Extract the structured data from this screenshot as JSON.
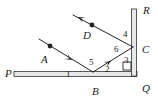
{
  "figure": {
    "type": "geometry-optics-diagram",
    "width": 158,
    "height": 99,
    "background_color": "#ffffff",
    "line_color": "#222222",
    "mirror_fill_color": "#e8e8e8"
  },
  "point_labels": [
    {
      "id": "P",
      "text": "P",
      "x": 5,
      "y": 68,
      "desc": "left end of horizontal mirror"
    },
    {
      "id": "A",
      "text": "A",
      "x": 41,
      "y": 54,
      "desc": "incident ray label"
    },
    {
      "id": "D",
      "text": "D",
      "x": 83,
      "y": 30,
      "desc": "outgoing reflected ray label"
    },
    {
      "id": "B",
      "text": "B",
      "x": 92,
      "y": 86,
      "desc": "reflection point on horizontal mirror"
    },
    {
      "id": "C",
      "text": "C",
      "x": 142,
      "y": 44,
      "desc": "reflection point on vertical mirror"
    },
    {
      "id": "R",
      "text": "R",
      "x": 143,
      "y": 5,
      "desc": "top end of vertical mirror"
    },
    {
      "id": "Q",
      "text": "Q",
      "x": 142,
      "y": 83,
      "desc": "bottom end of vertical mirror"
    }
  ],
  "angle_labels": [
    {
      "id": "angle1",
      "text": "1",
      "x": 66,
      "y": 70,
      "desc": "angle of incidence at B, left side"
    },
    {
      "id": "angle5",
      "text": "5",
      "x": 89,
      "y": 58,
      "desc": "angle between incident and reflected ray at B"
    },
    {
      "id": "angle2",
      "text": "2",
      "x": 105,
      "y": 65,
      "desc": "angle of reflection at B, right side"
    },
    {
      "id": "angle6",
      "text": "6",
      "x": 114,
      "y": 45,
      "desc": "angle at C between ray BC and ray CD"
    },
    {
      "id": "angle4",
      "text": "4",
      "x": 123,
      "y": 30,
      "desc": "angle at C above, between ray CD and mirror RQ"
    },
    {
      "id": "angle3",
      "text": "3",
      "x": 124,
      "y": 56,
      "desc": "angle at C below, between ray BC and mirror RQ"
    }
  ],
  "mirrors": [
    {
      "id": "mirror-PQ",
      "name": "horizontal-mirror",
      "label_start": "P",
      "label_end": "Q",
      "x1": 14,
      "y1": 74,
      "x2": 137,
      "y2": 74,
      "thickness": 5
    },
    {
      "id": "mirror-RQ",
      "name": "vertical-mirror",
      "label_start": "R",
      "label_end": "Q",
      "x1": 134,
      "y1": 9,
      "x2": 134,
      "y2": 76,
      "thickness": 5
    }
  ],
  "rays": [
    {
      "id": "ray-A",
      "name": "incident-ray-A",
      "label": "A",
      "x1": 39,
      "y1": 39,
      "x2": 93,
      "y2": 72,
      "arrow": "mid",
      "arrow_x": 72,
      "arrow_y": 60,
      "arrow_angle": 31,
      "dot_x": 50,
      "dot_y": 46
    },
    {
      "id": "ray-BC",
      "name": "reflected-ray-BC",
      "label": "",
      "x1": 93,
      "y1": 72,
      "x2": 133,
      "y2": 47,
      "arrow": "mid",
      "arrow_x": 111,
      "arrow_y": 61,
      "arrow_angle": -32,
      "dot_x": null,
      "dot_y": null
    },
    {
      "id": "ray-D",
      "name": "outgoing-ray-D",
      "label": "D",
      "x1": 133,
      "y1": 47,
      "x2": 73,
      "y2": 15,
      "arrow": "end",
      "arrow_x": 78,
      "arrow_y": 17,
      "arrow_angle": 208,
      "dot_x": 92,
      "dot_y": 25
    }
  ],
  "right_angle_marker": {
    "id": "right-angle-at-C",
    "name": "right-angle-square",
    "x": 123,
    "y": 62,
    "size": 8,
    "desc": "square marking the 90 degree angle 3 between ray BC region and mirror"
  },
  "legend": {
    "angles": [
      "1",
      "2",
      "3",
      "4",
      "5",
      "6"
    ],
    "points": [
      "P",
      "A",
      "B",
      "C",
      "D",
      "Q",
      "R"
    ]
  }
}
